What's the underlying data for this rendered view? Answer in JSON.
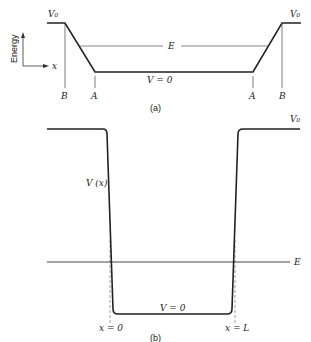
{
  "diagram": {
    "panel_a": {
      "caption": "(a)",
      "axis": {
        "y_label": "Energy",
        "x_label": "x"
      },
      "labels": {
        "v0_left": "V₀",
        "v0_right": "V₀",
        "energy": "E",
        "v_zero": "V = 0",
        "b_left": "B",
        "a_left": "A",
        "a_right": "A",
        "b_right": "B"
      }
    },
    "panel_b": {
      "caption": "(b)",
      "labels": {
        "v0_right": "V₀",
        "potential": "V (x)",
        "energy": "E",
        "v_zero": "V = 0",
        "x_zero": "x = 0",
        "x_L": "x = L"
      }
    },
    "colors": {
      "line": "#222222",
      "thin_line": "#555555",
      "dashed": "#777777",
      "background": "#ffffff"
    }
  }
}
